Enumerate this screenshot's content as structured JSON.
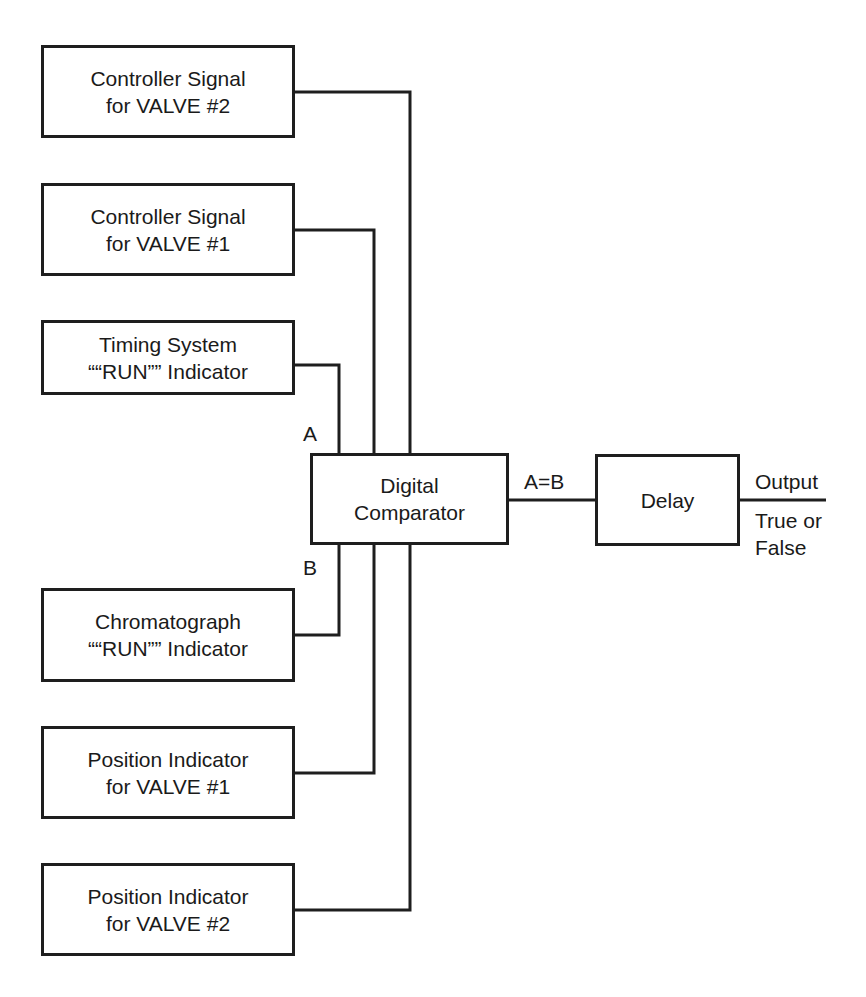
{
  "diagram": {
    "inputs": [
      {
        "id": "ctrl-valve2",
        "line1": "Controller Signal",
        "line2": "for VALVE #2"
      },
      {
        "id": "ctrl-valve1",
        "line1": "Controller Signal",
        "line2": "for VALVE #1"
      },
      {
        "id": "timing-run",
        "line1": "Timing System",
        "line2": "““RUN”” Indicator"
      },
      {
        "id": "chrom-run",
        "line1": "Chromatograph",
        "line2": "““RUN”” Indicator"
      },
      {
        "id": "pos-valve1",
        "line1": "Position Indicator",
        "line2": "for VALVE #1"
      },
      {
        "id": "pos-valve2",
        "line1": "Position Indicator",
        "line2": "for VALVE #2"
      }
    ],
    "comparator": {
      "line1": "Digital",
      "line2": "Comparator"
    },
    "delay": {
      "label": "Delay"
    },
    "labels": {
      "a": "A",
      "b": "B",
      "a_equals_b": "A=B",
      "output": "Output",
      "true_or": "True or",
      "false": "False"
    },
    "line_color": "#1e1e1e"
  }
}
